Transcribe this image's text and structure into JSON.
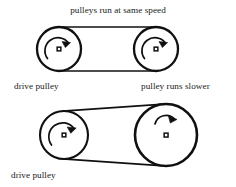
{
  "figure": {
    "title": "pulleys run at same speed",
    "background_color": "#ffffff",
    "stroke_color": "#101010",
    "text_color": "#1a1a1a"
  },
  "labels": {
    "top_left": "drive pulley",
    "top_right": "pulley runs slower",
    "bottom_left": "drive pulley"
  },
  "diagrams": [
    {
      "name": "equal-size-pulleys",
      "caption": "pulleys run at same speed",
      "belt": "flat belt spanning both pulleys",
      "pulleys": [
        {
          "role": "drive pulley",
          "label": "drive pulley",
          "center_x": 59,
          "center_y": 49,
          "radius": 22,
          "rotation": "clockwise",
          "hub_marker": "small-ring"
        },
        {
          "role": "driven pulley",
          "label": "",
          "center_x": 156,
          "center_y": 49,
          "radius": 22,
          "rotation": "clockwise",
          "hub_marker": "small-ring"
        }
      ]
    },
    {
      "name": "unequal-size-pulleys",
      "caption": "",
      "belt": "flat belt spanning small drive pulley and large driven pulley",
      "pulleys": [
        {
          "role": "drive pulley",
          "label": "drive pulley",
          "center_x": 64,
          "center_y": 135,
          "radius": 24,
          "rotation": "clockwise",
          "hub_marker": "small-ring"
        },
        {
          "role": "driven pulley",
          "label": "pulley runs slower",
          "center_x": 166,
          "center_y": 135,
          "radius": 31,
          "rotation": "clockwise",
          "hub_marker": "small-ring"
        }
      ]
    }
  ],
  "icons": {
    "rotation_arrow": "curved-arrow-clockwise-icon",
    "hub": "hub-dot-icon"
  }
}
